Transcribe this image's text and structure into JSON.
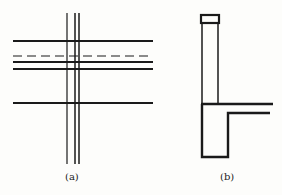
{
  "figure": {
    "panels": [
      {
        "id": "a",
        "caption": "(a)",
        "description": "Grid of horizontal lines crossed by three vertical lines; one horizontal line is dashed"
      },
      {
        "id": "b",
        "caption": "(b)",
        "description": "Section: tall narrow column with cap box at top, joined to a horizontal slab and an L-shaped footing"
      }
    ]
  },
  "colors": {
    "line": "#1a1a1a",
    "background": "#fdfdfb"
  }
}
